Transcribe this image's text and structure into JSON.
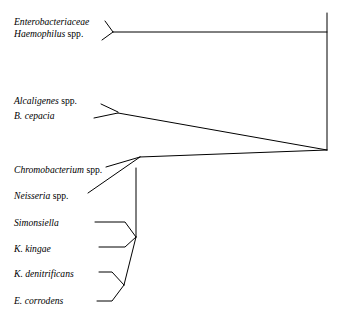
{
  "diagram": {
    "type": "phylogenetic-tree",
    "orientation": "right-rooted-cladogram",
    "background_color": "#ffffff",
    "line_color": "#000000",
    "taxa": [
      {
        "id": "enterobacteriaceae",
        "genus": "Enterobacteriaceae",
        "qualifier": "",
        "italic_all": true,
        "x": 14,
        "y": 16
      },
      {
        "id": "haemophilus",
        "genus": "Haemophilus",
        "qualifier": " spp.",
        "italic_all": false,
        "x": 14,
        "y": 28
      },
      {
        "id": "alcaligenes",
        "genus": "Alcaligenes",
        "qualifier": " spp.",
        "italic_all": false,
        "x": 14,
        "y": 95
      },
      {
        "id": "b-cepacia",
        "genus": "B. cepacia",
        "qualifier": "",
        "italic_all": true,
        "x": 14,
        "y": 110
      },
      {
        "id": "chromobacterium",
        "genus": "Chromobacterium",
        "qualifier": " spp.",
        "italic_all": false,
        "x": 14,
        "y": 164
      },
      {
        "id": "neisseria",
        "genus": "Neisseria",
        "qualifier": " spp.",
        "italic_all": false,
        "x": 14,
        "y": 190
      },
      {
        "id": "simonsiella",
        "genus": "Simonsiella",
        "qualifier": "",
        "italic_all": true,
        "x": 14,
        "y": 217
      },
      {
        "id": "k-kingae",
        "genus": "K. kingae",
        "qualifier": "",
        "italic_all": true,
        "x": 14,
        "y": 243
      },
      {
        "id": "k-denitrificans",
        "genus": "K. denitrificans",
        "qualifier": "",
        "italic_all": true,
        "x": 14,
        "y": 268
      },
      {
        "id": "e-corrodens",
        "genus": "E. corrodens",
        "qualifier": "",
        "italic_all": true,
        "x": 14,
        "y": 295
      }
    ],
    "branches": [
      {
        "id": "branch-enterobacteriaceae",
        "points": "105,21 113,32"
      },
      {
        "id": "branch-haemophilus",
        "points": "102,40 113,32"
      },
      {
        "id": "branch-enterics-stem",
        "points": "113,32 327,32"
      },
      {
        "id": "branch-trunk",
        "points": "327,13 327,150"
      },
      {
        "id": "branch-alcaligenes",
        "points": "101,104 118,112"
      },
      {
        "id": "branch-b-cepacia",
        "points": "94,118 118,113"
      },
      {
        "id": "branch-alcaligenes-stem",
        "points": "118,113 327,150"
      },
      {
        "id": "branch-lower-stem",
        "points": "140,157 327,150"
      },
      {
        "id": "branch-chromobacterium",
        "points": "106,167 140,157"
      },
      {
        "id": "branch-neisseria",
        "points": "88,193 140,157"
      },
      {
        "id": "branch-neisseriaceae-spine",
        "points": "136,168 136,237"
      },
      {
        "id": "branch-simonsiella",
        "points": "95,222 125,222 136,237"
      },
      {
        "id": "branch-k-kingae",
        "points": "99,247 125,247 136,237"
      },
      {
        "id": "branch-lower-clade-stem",
        "points": "136,237 124,285"
      },
      {
        "id": "branch-k-denitrificans",
        "points": "99,272 112,272 124,285"
      },
      {
        "id": "branch-e-corrodens",
        "points": "97,301 112,301 124,285"
      }
    ]
  }
}
